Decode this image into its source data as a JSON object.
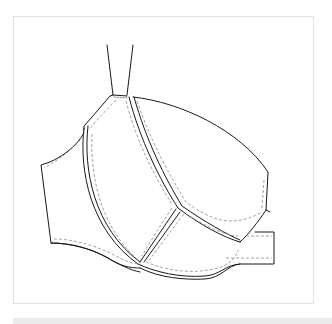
{
  "image": {
    "subject": "Technical flat sketch of an underwire bra (side view)",
    "style": "black line art with dashed stitch lines on white",
    "colors": {
      "background": "#ffffff",
      "frame_border": "#e2e2e2",
      "line": "#1a1a1a",
      "stitch": "#8a8a8a",
      "bottom_bar": "#ececec"
    }
  },
  "caption": ""
}
